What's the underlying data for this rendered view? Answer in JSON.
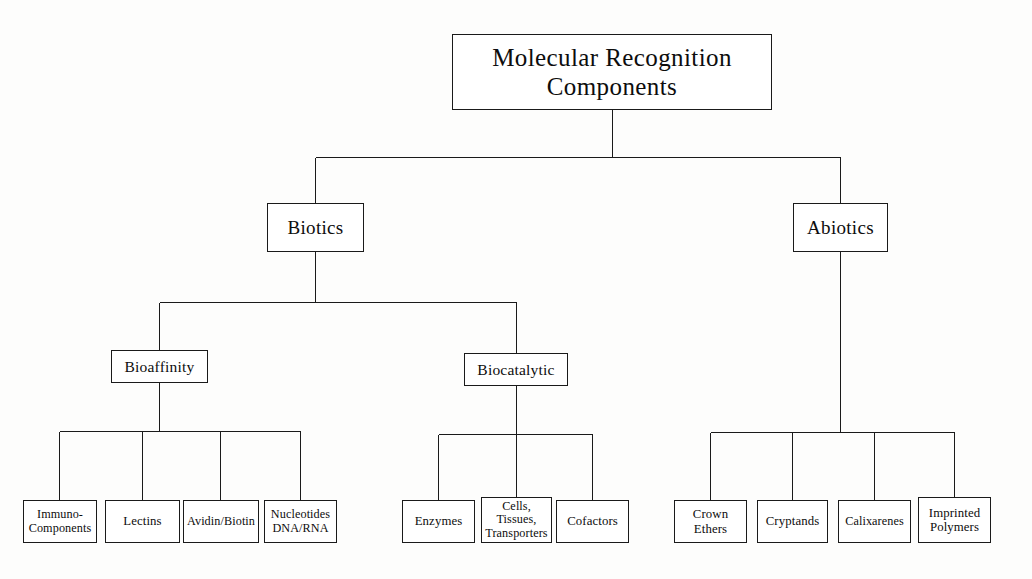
{
  "diagram": {
    "title": "Molecular Recognition Components",
    "type": "hierarchical-tree",
    "orientation": "top-down",
    "colors": {
      "background": "#fdfdfc",
      "box_fill": "#ffffff",
      "line": "#1a1a1a",
      "text": "#0d0d0d"
    },
    "nodes": {
      "root": {
        "label": "Molecular Recognition\nComponents",
        "level": 0,
        "x": 452,
        "y": 34,
        "w": 320,
        "h": 76
      },
      "biotics": {
        "label": "Biotics",
        "level": 1,
        "x": 267,
        "y": 203,
        "w": 97,
        "h": 49
      },
      "abiotics": {
        "label": "Abiotics",
        "level": 1,
        "x": 793,
        "y": 203,
        "w": 95,
        "h": 49
      },
      "bioaffinity": {
        "label": "Bioaffinity",
        "level": 2,
        "x": 111,
        "y": 350,
        "w": 97,
        "h": 33
      },
      "biocatalytic": {
        "label": "Biocatalytic",
        "level": 2,
        "x": 464,
        "y": 353,
        "w": 104,
        "h": 33
      },
      "immuno_components": {
        "label": "Immuno-\nComponents",
        "level": 3,
        "x": 23,
        "y": 500,
        "w": 74,
        "h": 43
      },
      "lectins": {
        "label": "Lectins",
        "level": 3,
        "x": 105,
        "y": 500,
        "w": 75,
        "h": 43
      },
      "avidin_biotin": {
        "label": "Avidin/Biotin",
        "level": 3,
        "x": 183,
        "y": 500,
        "w": 76,
        "h": 43
      },
      "nucleotides": {
        "label": "Nucleotides\nDNA/RNA",
        "level": 3,
        "x": 264,
        "y": 500,
        "w": 73,
        "h": 43
      },
      "enzymes": {
        "label": "Enzymes",
        "level": 3,
        "x": 402,
        "y": 500,
        "w": 73,
        "h": 43
      },
      "cells_tissues": {
        "label": "Cells,\nTissues,\nTransporters",
        "level": 3,
        "x": 481,
        "y": 497,
        "w": 71,
        "h": 46
      },
      "cofactors": {
        "label": "Cofactors",
        "level": 3,
        "x": 556,
        "y": 500,
        "w": 73,
        "h": 43
      },
      "crown_ethers": {
        "label": "Crown\nEthers",
        "level": 3,
        "x": 674,
        "y": 500,
        "w": 73,
        "h": 43
      },
      "cryptands": {
        "label": "Cryptands",
        "level": 3,
        "x": 757,
        "y": 500,
        "w": 71,
        "h": 43
      },
      "calixarenes": {
        "label": "Calixarenes",
        "level": 3,
        "x": 838,
        "y": 500,
        "w": 73,
        "h": 43
      },
      "imprinted_polymers": {
        "label": "Imprinted\nPolymers",
        "level": 3,
        "x": 918,
        "y": 497,
        "w": 73,
        "h": 46
      }
    },
    "edges": [
      {
        "from": "root",
        "to": "biotics"
      },
      {
        "from": "root",
        "to": "abiotics"
      },
      {
        "from": "biotics",
        "to": "bioaffinity"
      },
      {
        "from": "biotics",
        "to": "biocatalytic"
      },
      {
        "from": "bioaffinity",
        "to": "immuno_components"
      },
      {
        "from": "bioaffinity",
        "to": "lectins"
      },
      {
        "from": "bioaffinity",
        "to": "avidin_biotin"
      },
      {
        "from": "bioaffinity",
        "to": "nucleotides"
      },
      {
        "from": "biocatalytic",
        "to": "enzymes"
      },
      {
        "from": "biocatalytic",
        "to": "cells_tissues"
      },
      {
        "from": "biocatalytic",
        "to": "cofactors"
      },
      {
        "from": "abiotics",
        "to": "crown_ethers"
      },
      {
        "from": "abiotics",
        "to": "cryptands"
      },
      {
        "from": "abiotics",
        "to": "calixarenes"
      },
      {
        "from": "abiotics",
        "to": "imprinted_polymers"
      }
    ]
  }
}
